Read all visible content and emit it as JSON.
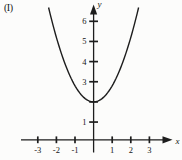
{
  "figure": {
    "index_label": "(I)",
    "x_axis_letter": "x",
    "y_axis_letter": "y"
  },
  "chart_data": {
    "type": "line",
    "title": "",
    "xlabel": "x",
    "ylabel": "y",
    "equation": "y = x^2 + 2",
    "vertex": [
      0,
      2
    ],
    "x": [
      -2,
      -1.5,
      -1,
      -0.5,
      0,
      0.5,
      1,
      1.5,
      2
    ],
    "y": [
      6,
      4.25,
      3,
      2.25,
      2,
      2.25,
      3,
      4.25,
      6
    ],
    "x_ticks_drawn": [
      -3,
      -2,
      -1,
      1,
      2,
      3
    ],
    "x_tick_labels": [
      "-3",
      "-2",
      "-1",
      "1",
      "2",
      "3"
    ],
    "y_ticks_drawn": [
      1,
      2,
      3,
      4,
      5,
      6
    ],
    "y_tick_labels": [
      "1",
      "3",
      "4",
      "5",
      "6"
    ],
    "xlim": [
      -3.9,
      4.2
    ],
    "ylim": [
      -0.5,
      6.8
    ],
    "grid": false,
    "legend": null
  },
  "layout": {
    "width": 182,
    "height": 160,
    "origin_px": {
      "x": 93.6,
      "y": 142.2
    },
    "unit_px": {
      "x": 18.6,
      "y": 20.15
    },
    "x_axis": {
      "x1": 21,
      "x2": 164,
      "y": 139.8,
      "arrow_tip_x": 172.5
    },
    "y_axis": {
      "y1": 13,
      "y2": 152.5,
      "x": 93.6,
      "arrow_tip_y": 4.5
    },
    "tick_half_len": {
      "x_axis": 3.4,
      "y_axis": 4.4
    },
    "curve": {
      "a": 0.8,
      "k": 2,
      "y_top_px": 7.5
    },
    "stroke": "#1d1d1d",
    "label_color": "#151515",
    "bg": "#fcfcfb",
    "x_letter_pos": {
      "x": 175.5,
      "y": 143.5
    },
    "y_letter_pos": {
      "x": 97.5,
      "y": 7
    }
  }
}
